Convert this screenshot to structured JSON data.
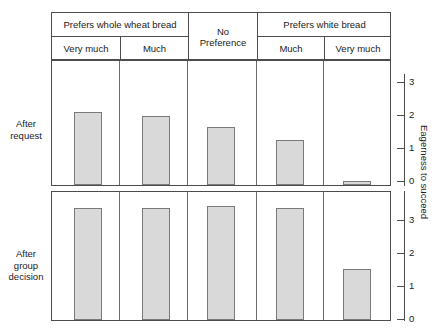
{
  "figure": {
    "width": 447,
    "height": 332,
    "background": "#ffffff",
    "bar_fill": "#d9d9d9",
    "bar_stroke": "#7a7a7a",
    "line_color": "#4d4d4d"
  },
  "header": {
    "group_labels": [
      {
        "text": "Prefers whole wheat bread",
        "span": 2
      },
      {
        "text": "No Preference",
        "span": 1
      },
      {
        "text": "Prefers white bread",
        "span": 2
      }
    ],
    "sub_labels": [
      "Very much",
      "Much",
      "Much",
      "Very much"
    ],
    "no_pref_line1": "No",
    "no_pref_line2": "Preference"
  },
  "row_labels": {
    "top_line1": "After",
    "top_line2": "request",
    "bottom_line1": "After",
    "bottom_line2": "group",
    "bottom_line3": "decision"
  },
  "axis": {
    "y_title": "Eagerness to succeed",
    "top_ticks": [
      "3",
      "2",
      "1",
      "0"
    ],
    "bottom_ticks": [
      "3",
      "2",
      "1",
      "0"
    ]
  },
  "chart_data": {
    "type": "bar",
    "title": "",
    "subtitle": "",
    "xlabel": "",
    "ylabel": "Eagerness to succeed",
    "grid": false,
    "legend_position": "none",
    "categories": [
      "Prefers whole wheat bread — Very much",
      "Prefers whole wheat bread — Much",
      "No Preference",
      "Prefers white bread — Much",
      "Prefers white bread — Very much"
    ],
    "category_groups": [
      "Prefers whole wheat bread",
      "Prefers whole wheat bread",
      "No Preference",
      "Prefers white bread",
      "Prefers white bread"
    ],
    "category_sublabels": [
      "Very much",
      "Much",
      "",
      "Much",
      "Very much"
    ],
    "panels": [
      {
        "name": "After request",
        "ylim": [
          0,
          3.4
        ],
        "yticks": [
          0,
          1,
          2,
          3
        ],
        "values": [
          2.2,
          2.1,
          1.75,
          1.35,
          0.1
        ]
      },
      {
        "name": "After group decision",
        "ylim": [
          0,
          3.7
        ],
        "yticks": [
          0,
          1,
          2,
          3
        ],
        "values": [
          3.4,
          3.4,
          3.45,
          3.4,
          1.55
        ]
      }
    ],
    "series": [
      {
        "name": "After request",
        "values": [
          2.2,
          2.1,
          1.75,
          1.35,
          0.1
        ]
      },
      {
        "name": "After group decision",
        "values": [
          3.4,
          3.4,
          3.45,
          3.4,
          1.55
        ]
      }
    ]
  }
}
